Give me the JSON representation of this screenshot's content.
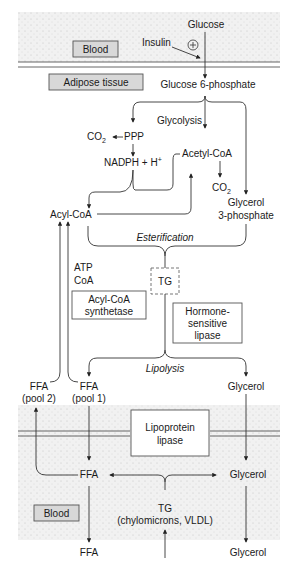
{
  "regions": {
    "blood_top": "Blood",
    "adipose": "Adipose tissue",
    "blood_bottom": "Blood"
  },
  "colors": {
    "blood_region": "#eeeeee",
    "label_box": "#d8d8d8",
    "line": "#333333"
  },
  "nodes": {
    "glucose": "Glucose",
    "insulin": "Insulin",
    "insulin_sign": "+",
    "g6p": "Glucose 6-phosphate",
    "glycolysis": "Glycolysis",
    "co2_ppp": "CO",
    "co2_sub": "2",
    "ppp": "PPP",
    "nadph": "NADPH + H",
    "nadph_sup": "+",
    "acetyl_coa": "Acetyl-CoA",
    "co2_acetyl": "CO",
    "acyl_coa": "Acyl-CoA",
    "glycerol3p_1": "Glycerol",
    "glycerol3p_2": "3-phosphate",
    "esterification": "Esterification",
    "atp": "ATP",
    "coa": "CoA",
    "tg": "TG",
    "acyl_synth_1": "Acyl-CoA",
    "acyl_synth_2": "synthetase",
    "hsl_1": "Hormone-",
    "hsl_2": "sensitive",
    "hsl_3": "lipase",
    "lipolysis": "Lipolysis",
    "ffa_pool2_1": "FFA",
    "ffa_pool2_2": "(pool 2)",
    "ffa_pool1_1": "FFA",
    "ffa_pool1_2": "(pool 1)",
    "glycerol_tissue": "Glycerol",
    "lpl_1": "Lipoprotein",
    "lpl_2": "lipase",
    "ffa_blood": "FFA",
    "glycerol_blood": "Glycerol",
    "tg_blood_1": "TG",
    "tg_blood_2": "(chylomicrons, VLDL)",
    "ffa_out": "FFA",
    "glycerol_out": "Glycerol"
  }
}
